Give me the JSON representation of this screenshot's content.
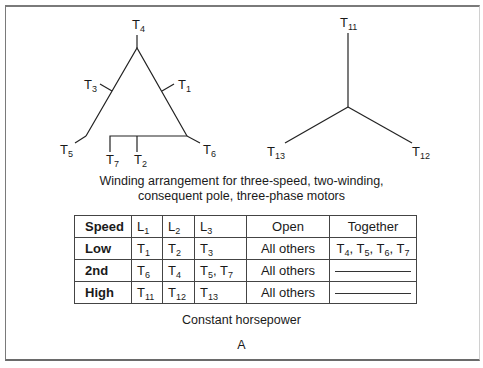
{
  "delta_winding": {
    "labels": {
      "top": {
        "base": "T",
        "sub": "4"
      },
      "left_mid": {
        "base": "T",
        "sub": "3"
      },
      "right_mid": {
        "base": "T",
        "sub": "1"
      },
      "bottom_left": {
        "base": "T",
        "sub": "5"
      },
      "bottom_right": {
        "base": "T",
        "sub": "6"
      },
      "tap_left": {
        "base": "T",
        "sub": "7"
      },
      "tap_mid": {
        "base": "T",
        "sub": "2"
      }
    }
  },
  "wye_winding": {
    "labels": {
      "top": {
        "base": "T",
        "sub": "11"
      },
      "bottom_left": {
        "base": "T",
        "sub": "13"
      },
      "bottom_right": {
        "base": "T",
        "sub": "12"
      }
    }
  },
  "caption": {
    "line1": "Winding arrangement for three-speed, two-winding,",
    "line2": "consequent pole, three-phase motors"
  },
  "table": {
    "headers": [
      {
        "base": "Speed",
        "sub": ""
      },
      {
        "base": "L",
        "sub": "1"
      },
      {
        "base": "L",
        "sub": "2"
      },
      {
        "base": "L",
        "sub": "3"
      },
      {
        "base": "Open",
        "sub": ""
      },
      {
        "base": "Together",
        "sub": ""
      }
    ],
    "rows": [
      {
        "speed": "Low",
        "l1": {
          "base": "T",
          "sub": "1"
        },
        "l2": {
          "base": "T",
          "sub": "2"
        },
        "l3": {
          "base": "T",
          "sub": "3"
        },
        "open": "All others",
        "together": "T4, T5, T6, T7"
      },
      {
        "speed": "2nd",
        "l1": {
          "base": "T",
          "sub": "6"
        },
        "l2": {
          "base": "T",
          "sub": "4"
        },
        "l3": {
          "base": "T",
          "sub": "5, T7"
        },
        "open": "All others",
        "together": "—"
      },
      {
        "speed": "High",
        "l1": {
          "base": "T",
          "sub": "11"
        },
        "l2": {
          "base": "T",
          "sub": "12"
        },
        "l3": {
          "base": "T",
          "sub": "13"
        },
        "open": "All others",
        "together": "—"
      }
    ],
    "together_low": [
      {
        "base": "T",
        "sub": "4"
      },
      {
        "base": "T",
        "sub": "5"
      },
      {
        "base": "T",
        "sub": "6"
      },
      {
        "base": "T",
        "sub": "7"
      }
    ],
    "l3_2nd": [
      {
        "base": "T",
        "sub": "5"
      },
      {
        "base": "T",
        "sub": "7"
      }
    ]
  },
  "footer": {
    "subtitle": "Constant horsepower",
    "figure_label": "A"
  }
}
